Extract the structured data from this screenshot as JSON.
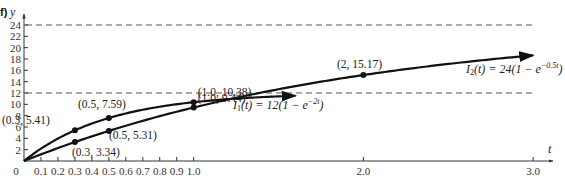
{
  "panel_label": "f)",
  "chart_data": {
    "type": "line",
    "title": "",
    "xlabel": "t",
    "ylabel": "y",
    "xlim": [
      0,
      3.0
    ],
    "ylim": [
      0,
      24
    ],
    "grid": false,
    "x_ticks": [
      0,
      0.1,
      0.2,
      0.3,
      0.4,
      0.5,
      0.6,
      0.7,
      0.8,
      0.9,
      1.0,
      2.0,
      3.0
    ],
    "x_tick_labels": [
      "0",
      "0.1",
      "0.2",
      "0.3",
      "0.4",
      "0.5",
      "0.6",
      "0.7",
      "0.8",
      "0.9",
      "1.0",
      "2.0",
      "3.0"
    ],
    "y_ticks": [
      2,
      4,
      6,
      8,
      10,
      12,
      14,
      16,
      18,
      20,
      22,
      24
    ],
    "y_tick_labels": [
      "2",
      "4",
      "6",
      "8",
      "10",
      "12",
      "14",
      "16",
      "18",
      "20",
      "22",
      "24"
    ],
    "asymptotes": [
      {
        "y": 24,
        "style": "dashed"
      },
      {
        "y": 12,
        "style": "dashed"
      }
    ],
    "series": [
      {
        "name": "I1(t) = 12(1 − e^(−2t))",
        "label": "I₁(t) = 12(1 − e⁻²ᵗ)",
        "formula": {
          "A": 12,
          "k": 2
        },
        "t_end": 1.6,
        "points": [
          {
            "t": 0.3,
            "y": 5.41,
            "label": "(0.3, 5.41)"
          },
          {
            "t": 0.5,
            "y": 7.59,
            "label": "(0.5, 7.59)"
          },
          {
            "t": 1.0,
            "y": 10.38,
            "label": "(1.0, 10.38)"
          }
        ]
      },
      {
        "name": "I2(t) = 24(1 − e^(−0.5t))",
        "label": "I₂(t) = 24(1 − e⁻⁰·⁵ᵗ)",
        "formula": {
          "A": 24,
          "k": 0.5
        },
        "t_end": 3.0,
        "points": [
          {
            "t": 0.3,
            "y": 3.34,
            "label": "(0.3, 3.34)"
          },
          {
            "t": 0.5,
            "y": 5.31,
            "label": "(0.5, 5.31)"
          },
          {
            "t": 1.0,
            "y": 9.44,
            "label": "(1.0, 9.44)"
          },
          {
            "t": 2.0,
            "y": 15.17,
            "label": "(2, 15.17)"
          }
        ]
      }
    ]
  }
}
